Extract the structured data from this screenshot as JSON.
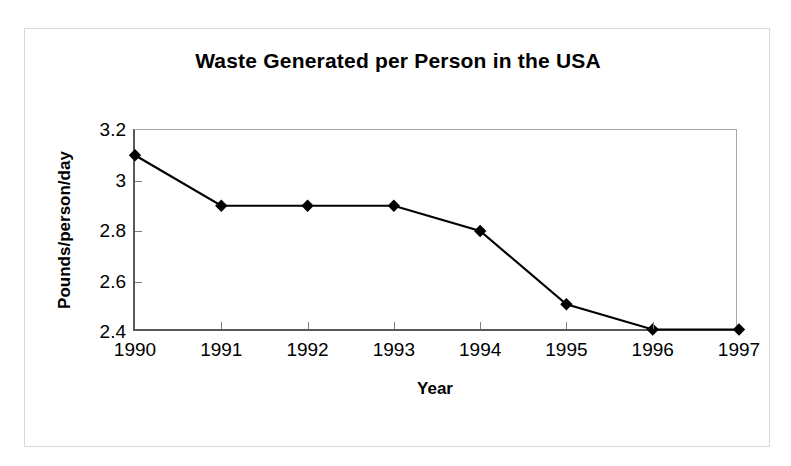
{
  "figure": {
    "title": "Waste Generated per Person in the USA",
    "border_color": "#d9d9d9",
    "background": "#ffffff"
  },
  "chart_data": {
    "type": "line",
    "title": "Waste Generated per Person in the USA",
    "xlabel": "Year",
    "ylabel": "Pounds/person/day",
    "categories": [
      "1990",
      "1991",
      "1992",
      "1993",
      "1994",
      "1995",
      "1996",
      "1997"
    ],
    "values": [
      3.1,
      2.9,
      2.9,
      2.9,
      2.8,
      2.51,
      2.41,
      2.41
    ],
    "series": [
      {
        "name": "Pounds/person/day",
        "values": [
          3.1,
          2.9,
          2.9,
          2.9,
          2.8,
          2.51,
          2.41,
          2.41
        ],
        "line_color": "#000000",
        "marker": "diamond",
        "marker_color": "#000000"
      }
    ],
    "ylim": [
      2.4,
      3.2
    ],
    "yticks": [
      2.4,
      2.6,
      2.8,
      3.0,
      3.2
    ],
    "ytick_labels": [
      "2.4",
      "2.6",
      "2.8",
      "3",
      "3.2"
    ],
    "grid": false,
    "legend": false,
    "legend_position": "none",
    "axis_color": "#595959",
    "tick_color": "#808080"
  }
}
